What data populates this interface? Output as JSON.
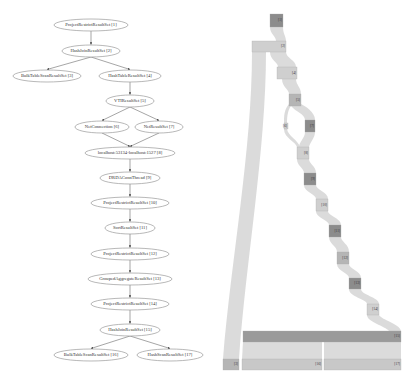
{
  "plan_tree": {
    "nodes": [
      {
        "id": 1,
        "label": "ProjectRestrictResultSet [1]",
        "cx": 91,
        "cy": 25,
        "rx": 37,
        "ry": 6
      },
      {
        "id": 2,
        "label": "HashJoinResultSet [2]",
        "cx": 91,
        "cy": 51,
        "rx": 29,
        "ry": 6
      },
      {
        "id": 3,
        "label": "BulkTableScanResultSet [3]",
        "cx": 47,
        "cy": 76,
        "rx": 34,
        "ry": 6
      },
      {
        "id": 4,
        "label": "HashTableResultSet [4]",
        "cx": 130,
        "cy": 76,
        "rx": 31,
        "ry": 6
      },
      {
        "id": 5,
        "label": "VTIResultSet [5]",
        "cx": 130,
        "cy": 101,
        "rx": 24,
        "ry": 6
      },
      {
        "id": 6,
        "label": "NetConnection [6]",
        "cx": 102,
        "cy": 127,
        "rx": 27,
        "ry": 6
      },
      {
        "id": 7,
        "label": "NetResultSet [7]",
        "cx": 159,
        "cy": 127,
        "rx": 24,
        "ry": 6
      },
      {
        "id": 8,
        "label": "localhost:53134-localhost:1527 [8]",
        "cx": 130,
        "cy": 153,
        "rx": 45,
        "ry": 6
      },
      {
        "id": 9,
        "label": "DRDAConnThread [9]",
        "cx": 130,
        "cy": 178,
        "rx": 30,
        "ry": 6
      },
      {
        "id": 10,
        "label": "ProjectRestrictResultSet [10]",
        "cx": 130,
        "cy": 203,
        "rx": 39,
        "ry": 6
      },
      {
        "id": 11,
        "label": "SortResultSet [11]",
        "cx": 130,
        "cy": 228,
        "rx": 25,
        "ry": 6
      },
      {
        "id": 12,
        "label": "ProjectRestrictResultSet [12]",
        "cx": 130,
        "cy": 254,
        "rx": 39,
        "ry": 6
      },
      {
        "id": 13,
        "label": "GroupedAggregateResultSet [13]",
        "cx": 130,
        "cy": 279,
        "rx": 42,
        "ry": 6
      },
      {
        "id": 14,
        "label": "ProjectRestrictResultSet [14]",
        "cx": 130,
        "cy": 304,
        "rx": 39,
        "ry": 6
      },
      {
        "id": 15,
        "label": "HashJoinResultSet [15]",
        "cx": 130,
        "cy": 330,
        "rx": 30,
        "ry": 6
      },
      {
        "id": 16,
        "label": "BulkTableScanResultSet [16]",
        "cx": 91,
        "cy": 355,
        "rx": 37,
        "ry": 6
      },
      {
        "id": 17,
        "label": "HashScanResultSet [17]",
        "cx": 170,
        "cy": 355,
        "rx": 33,
        "ry": 6
      }
    ],
    "edges": [
      [
        1,
        2
      ],
      [
        2,
        3
      ],
      [
        2,
        4
      ],
      [
        4,
        5
      ],
      [
        5,
        6
      ],
      [
        5,
        7
      ],
      [
        6,
        8
      ],
      [
        7,
        8
      ],
      [
        8,
        9
      ],
      [
        9,
        10
      ],
      [
        10,
        11
      ],
      [
        11,
        12
      ],
      [
        12,
        13
      ],
      [
        13,
        14
      ],
      [
        14,
        15
      ],
      [
        15,
        16
      ],
      [
        15,
        17
      ]
    ]
  },
  "flow_diagram": {
    "colors": {
      "flow": "#d9d9d9",
      "light_box": "#cfcfcf",
      "mid_box": "#b5b5b5",
      "dark_box": "#8c8c8c",
      "long_bar": "#9a9a9a",
      "bottom_bar": "#c8c8c8"
    },
    "boxes": [
      {
        "label": "[1]",
        "x": 270,
        "y": 14,
        "w": 13,
        "h": 13,
        "shade": "dark_box"
      },
      {
        "label": "[2]",
        "x": 252,
        "y": 41,
        "w": 34,
        "h": 11,
        "shade": "light_box"
      },
      {
        "label": "[4]",
        "x": 277,
        "y": 67,
        "w": 20,
        "h": 12,
        "shade": "light_box"
      },
      {
        "label": "[5]",
        "x": 289,
        "y": 94,
        "w": 12,
        "h": 12,
        "shade": "mid_box"
      },
      {
        "label": "[6]",
        "x": 284,
        "y": 123,
        "w": 4,
        "h": 6,
        "shade": "light_box"
      },
      {
        "label": "[7]",
        "x": 305,
        "y": 120,
        "w": 10,
        "h": 12,
        "shade": "dark_box"
      },
      {
        "label": "[8]",
        "x": 297,
        "y": 147,
        "w": 12,
        "h": 12,
        "shade": "light_box"
      },
      {
        "label": "[9]",
        "x": 304,
        "y": 173,
        "w": 12,
        "h": 12,
        "shade": "dark_box"
      },
      {
        "label": "[10]",
        "x": 316,
        "y": 199,
        "w": 12,
        "h": 12,
        "shade": "light_box"
      },
      {
        "label": "[11]",
        "x": 329,
        "y": 225,
        "w": 12,
        "h": 12,
        "shade": "dark_box"
      },
      {
        "label": "[12]",
        "x": 337,
        "y": 252,
        "w": 12,
        "h": 12,
        "shade": "mid_box"
      },
      {
        "label": "[13]",
        "x": 349,
        "y": 278,
        "w": 12,
        "h": 11,
        "shade": "dark_box"
      },
      {
        "label": "[14]",
        "x": 367,
        "y": 304,
        "w": 12,
        "h": 11,
        "shade": "light_box"
      },
      {
        "label": "[15]",
        "x": 243,
        "y": 331,
        "w": 158,
        "h": 11,
        "shade": "long_bar"
      },
      {
        "label": "[3]",
        "x": 223,
        "y": 359,
        "w": 16,
        "h": 11,
        "shade": "mid_box"
      },
      {
        "label": "[16]",
        "x": 242,
        "y": 359,
        "w": 80,
        "h": 11,
        "shade": "bottom_bar"
      },
      {
        "label": "[17]",
        "x": 324,
        "y": 359,
        "w": 77,
        "h": 11,
        "shade": "bottom_bar"
      }
    ]
  }
}
